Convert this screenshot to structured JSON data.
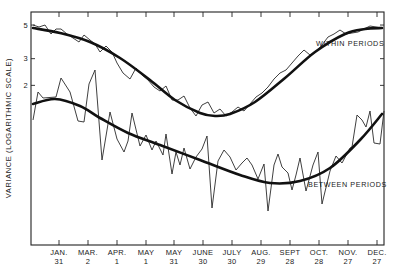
{
  "chart_data": {
    "type": "line",
    "title": "",
    "xlabel": "",
    "ylabel": "VARIANCE (LOGARITHMIC SCALE)",
    "yscale": "log",
    "ylim": [
      1.8,
      60
    ],
    "grid": false,
    "legend_position": "inline labels",
    "x_ticks": [
      {
        "line1": "JAN.",
        "line2": "31"
      },
      {
        "line1": "MAR.",
        "line2": "2"
      },
      {
        "line1": "APR.",
        "line2": "1"
      },
      {
        "line1": "MAY",
        "line2": "1"
      },
      {
        "line1": "MAY",
        "line2": "31"
      },
      {
        "line1": "JUNE",
        "line2": "30"
      },
      {
        "line1": "JULY",
        "line2": "30"
      },
      {
        "line1": "AUG.",
        "line2": "29"
      },
      {
        "line1": "SEPT",
        "line2": "28"
      },
      {
        "line1": "OCT.",
        "line2": "28"
      },
      {
        "line1": "NOV.",
        "line2": "27"
      },
      {
        "line1": "DEC.",
        "line2": "27"
      }
    ],
    "y_ticks": [
      2,
      3,
      5,
      10,
      15,
      20,
      30,
      40,
      50,
      60
    ],
    "annotations": [
      {
        "text": "WITHIN PERIODS",
        "series": "within_periods"
      },
      {
        "text": "BETWEEN PERIODS",
        "series": "between_periods"
      }
    ],
    "series": [
      {
        "name": "WITHIN PERIODS",
        "id": "within_periods",
        "style": "raw",
        "points_px": [
          [
            33,
            25
          ],
          [
            39,
            27
          ],
          [
            45,
            25
          ],
          [
            51,
            34
          ],
          [
            56,
            29
          ],
          [
            61,
            29
          ],
          [
            67,
            34
          ],
          [
            73,
            38
          ],
          [
            79,
            42
          ],
          [
            84,
            35
          ],
          [
            90,
            40
          ],
          [
            95,
            44
          ],
          [
            100,
            52
          ],
          [
            106,
            46
          ],
          [
            112,
            52
          ],
          [
            117,
            63
          ],
          [
            123,
            73
          ],
          [
            130,
            79
          ],
          [
            136,
            68
          ],
          [
            142,
            75
          ],
          [
            148,
            80
          ],
          [
            154,
            87
          ],
          [
            160,
            91
          ],
          [
            166,
            86
          ],
          [
            172,
            100
          ],
          [
            178,
            100
          ],
          [
            184,
            96
          ],
          [
            190,
            108
          ],
          [
            196,
            116
          ],
          [
            202,
            105
          ],
          [
            208,
            102
          ],
          [
            214,
            113
          ],
          [
            220,
            109
          ],
          [
            226,
            116
          ],
          [
            232,
            112
          ],
          [
            238,
            107
          ],
          [
            244,
            111
          ],
          [
            250,
            104
          ],
          [
            256,
            97
          ],
          [
            262,
            93
          ],
          [
            268,
            87
          ],
          [
            274,
            79
          ],
          [
            280,
            73
          ],
          [
            286,
            70
          ],
          [
            292,
            63
          ],
          [
            298,
            56
          ],
          [
            304,
            50
          ],
          [
            310,
            55
          ],
          [
            316,
            52
          ],
          [
            322,
            45
          ],
          [
            328,
            37
          ],
          [
            334,
            34
          ],
          [
            340,
            30
          ],
          [
            346,
            34
          ],
          [
            352,
            33
          ],
          [
            358,
            32
          ],
          [
            364,
            29
          ],
          [
            370,
            26
          ],
          [
            376,
            27
          ],
          [
            381,
            28
          ]
        ],
        "approx_values": [
          50,
          47,
          50,
          36,
          43,
          43,
          36,
          32,
          28,
          36,
          30,
          27,
          20,
          25,
          20,
          14,
          12,
          11,
          15,
          12.5,
          11,
          9.7,
          8.5,
          9.5,
          6.6,
          6.6,
          7.4,
          5.4,
          4.1,
          5.8,
          6.3,
          4.6,
          5.3,
          4.1,
          4.8,
          5.5,
          4.9,
          6.1,
          7.6,
          8.6,
          10,
          12.6,
          15,
          16.5,
          20,
          26,
          29,
          26,
          29,
          36,
          45,
          49,
          55,
          49,
          50,
          52,
          56,
          61,
          60,
          58
        ]
      },
      {
        "name": "WITHIN PERIODS (smoothed)",
        "id": "within_periods_smooth",
        "style": "smooth",
        "points_px": [
          [
            33,
            28
          ],
          [
            60,
            33
          ],
          [
            90,
            42
          ],
          [
            120,
            58
          ],
          [
            150,
            80
          ],
          [
            175,
            100
          ],
          [
            200,
            113
          ],
          [
            215,
            116
          ],
          [
            230,
            114
          ],
          [
            255,
            102
          ],
          [
            285,
            78
          ],
          [
            315,
            52
          ],
          [
            345,
            34
          ],
          [
            365,
            29
          ],
          [
            382,
            28
          ]
        ],
        "approx_values": [
          48,
          44,
          38,
          30,
          22,
          16,
          13,
          12.5,
          12.8,
          15.5,
          22,
          33,
          43,
          47,
          48
        ]
      },
      {
        "name": "BETWEEN PERIODS",
        "id": "between_periods",
        "style": "raw",
        "points_px": [
          [
            33,
            120
          ],
          [
            38,
            92
          ],
          [
            43,
            98
          ],
          [
            56,
            97
          ],
          [
            61,
            78
          ],
          [
            70,
            92
          ],
          [
            78,
            121
          ],
          [
            84,
            122
          ],
          [
            89,
            84
          ],
          [
            95,
            70
          ],
          [
            102,
            160
          ],
          [
            110,
            112
          ],
          [
            117,
            139
          ],
          [
            124,
            152
          ],
          [
            128,
            141
          ],
          [
            132,
            113
          ],
          [
            140,
            146
          ],
          [
            146,
            135
          ],
          [
            152,
            150
          ],
          [
            156,
            141
          ],
          [
            163,
            155
          ],
          [
            166,
            134
          ],
          [
            172,
            174
          ],
          [
            176,
            152
          ],
          [
            180,
            165
          ],
          [
            184,
            148
          ],
          [
            190,
            169
          ],
          [
            196,
            157
          ],
          [
            202,
            149
          ],
          [
            207,
            136
          ],
          [
            212,
            208
          ],
          [
            218,
            161
          ],
          [
            224,
            150
          ],
          [
            230,
            157
          ],
          [
            236,
            170
          ],
          [
            242,
            163
          ],
          [
            247,
            158
          ],
          [
            252,
            165
          ],
          [
            258,
            179
          ],
          [
            264,
            164
          ],
          [
            268,
            211
          ],
          [
            274,
            165
          ],
          [
            278,
            154
          ],
          [
            282,
            167
          ],
          [
            288,
            173
          ],
          [
            292,
            190
          ],
          [
            296,
            175
          ],
          [
            300,
            158
          ],
          [
            306,
            191
          ],
          [
            313,
            165
          ],
          [
            318,
            152
          ],
          [
            322,
            204
          ],
          [
            330,
            171
          ],
          [
            336,
            156
          ],
          [
            342,
            163
          ],
          [
            350,
            148
          ],
          [
            352,
            147
          ],
          [
            357,
            115
          ],
          [
            362,
            120
          ],
          [
            366,
            127
          ],
          [
            370,
            111
          ],
          [
            374,
            143
          ],
          [
            380,
            144
          ],
          [
            384,
            111
          ]
        ],
        "approx_values": [
          11.8,
          18,
          16.3,
          16.6,
          22,
          18,
          11.6,
          11.5,
          19.4,
          24,
          6.4,
          13.2,
          8.8,
          7.2,
          8.4,
          12.8,
          8,
          9.2,
          7.3,
          8.4,
          6.9,
          9.3,
          5.2,
          7.1,
          5.8,
          7.6,
          5.6,
          6.6,
          7.5,
          9.1,
          3.1,
          6.4,
          7.6,
          6.7,
          5.5,
          6.2,
          6.6,
          6,
          4.8,
          6,
          3,
          5.9,
          7.1,
          5.8,
          5.3,
          4.1,
          5.2,
          6.6,
          4,
          5.9,
          7.3,
          3.3,
          5.4,
          6.8,
          6.1,
          7.7,
          7.8,
          12.7,
          11.8,
          10.6,
          13.6,
          8.3,
          8.2,
          13.6
        ]
      },
      {
        "name": "BETWEEN PERIODS (smoothed)",
        "id": "between_periods_smooth",
        "style": "smooth",
        "points_px": [
          [
            33,
            104
          ],
          [
            55,
            99
          ],
          [
            80,
            106
          ],
          [
            100,
            118
          ],
          [
            128,
            133
          ],
          [
            160,
            145
          ],
          [
            200,
            160
          ],
          [
            240,
            175
          ],
          [
            270,
            183
          ],
          [
            300,
            181
          ],
          [
            330,
            168
          ],
          [
            360,
            140
          ],
          [
            382,
            114
          ]
        ],
        "approx_values": [
          15,
          16.2,
          14.6,
          12.2,
          9.7,
          8.1,
          6.4,
          5.1,
          4.5,
          4.6,
          5.7,
          8.7,
          13
        ]
      }
    ],
    "layout": {
      "plot_left": 31,
      "plot_right": 384,
      "plot_top": 12,
      "plot_bottom": 245,
      "y_px_at_10": 131,
      "px_per_decade": 151.6,
      "x_tick_px": [
        59,
        88,
        117,
        146,
        174,
        203,
        232,
        261,
        290,
        319,
        348,
        377
      ],
      "within_label_xy": [
        316,
        46
      ],
      "between_label_xy": [
        308,
        187
      ]
    }
  }
}
